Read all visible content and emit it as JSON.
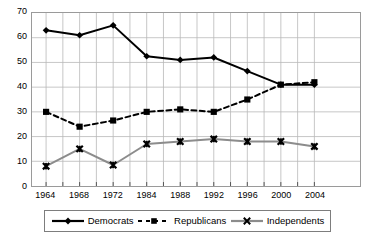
{
  "chart_data": {
    "type": "line",
    "title": "",
    "subtitle": "",
    "xlabel": "",
    "ylabel": "",
    "categories": [
      "1964",
      "1968",
      "1972",
      "1984",
      "1988",
      "1992",
      "1996",
      "2000",
      "2004"
    ],
    "x": [
      1964,
      1968,
      1972,
      1984,
      1988,
      1992,
      1996,
      2000,
      2004
    ],
    "xlim": [
      1962,
      2006
    ],
    "ylim": [
      0,
      70
    ],
    "yticks": [
      0,
      10,
      20,
      30,
      40,
      50,
      60,
      70
    ],
    "ytick_labels": [
      "0",
      "10",
      "20",
      "30",
      "40",
      "50",
      "60",
      "70"
    ],
    "xtick_labels": [
      "1964",
      "1968",
      "1972",
      "1984",
      "1988",
      "1992",
      "1996",
      "2000",
      "2004"
    ],
    "grid": true,
    "grid_color": "#b8b8b8",
    "legend_position": "bottom",
    "series": [
      {
        "name": "Democrats",
        "color": "#000000",
        "line_style": "solid",
        "marker": "diamond",
        "values": [
          63,
          61,
          65,
          52.5,
          51,
          52,
          46.5,
          41,
          41
        ]
      },
      {
        "name": "Republicans",
        "color": "#000000",
        "line_style": "dashed",
        "marker": "square",
        "values": [
          30,
          24,
          26.5,
          30,
          31,
          30,
          35,
          41,
          42
        ]
      },
      {
        "name": "Independents",
        "color": "#8c8c8c",
        "line_style": "solid",
        "marker": "x",
        "values": [
          8,
          15,
          8.5,
          17,
          18,
          19,
          18,
          18,
          16
        ]
      }
    ]
  },
  "legend": {
    "items": [
      {
        "label": "Democrats"
      },
      {
        "label": "Republicans"
      },
      {
        "label": "Independents"
      }
    ]
  },
  "axes": {
    "y_tick_0": "0",
    "y_tick_1": "10",
    "y_tick_2": "20",
    "y_tick_3": "30",
    "y_tick_4": "40",
    "y_tick_5": "50",
    "y_tick_6": "60",
    "y_tick_7": "70",
    "x_tick_0": "1964",
    "x_tick_1": "1968",
    "x_tick_2": "1972",
    "x_tick_3": "1984",
    "x_tick_4": "1988",
    "x_tick_5": "1992",
    "x_tick_6": "1996",
    "x_tick_7": "2000",
    "x_tick_8": "2004"
  }
}
